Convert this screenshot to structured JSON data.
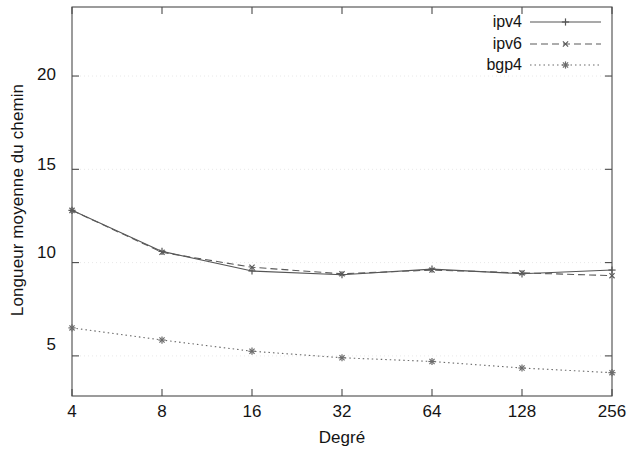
{
  "chart_data": {
    "type": "line",
    "title": "",
    "xlabel": "Degré",
    "ylabel": "Longueur moyenne du chemin",
    "x": [
      4,
      8,
      16,
      32,
      64,
      128,
      256
    ],
    "categories": [
      "4",
      "8",
      "16",
      "32",
      "64",
      "128",
      "256"
    ],
    "xscale": "log2",
    "xtick_labels": [
      "4",
      "8",
      "16",
      "32",
      "64",
      "128",
      "256"
    ],
    "ytick_labels": [
      "5",
      "10",
      "15",
      "20"
    ],
    "ytick_values": [
      5,
      10,
      15,
      20
    ],
    "ylim": [
      2.85,
      23.7
    ],
    "grid": true,
    "grid_style": "dotted",
    "legend_position": "top-right",
    "series": [
      {
        "name": "ipv4",
        "values": [
          12.8,
          10.6,
          9.55,
          9.35,
          9.65,
          9.4,
          9.6
        ],
        "line_style": "solid",
        "marker": "plus",
        "color": "#555555"
      },
      {
        "name": "ipv6",
        "values": [
          12.8,
          10.55,
          9.75,
          9.4,
          9.6,
          9.45,
          9.3
        ],
        "line_style": "dashed",
        "marker": "cross",
        "color": "#5a5a5a"
      },
      {
        "name": "bgp4",
        "values": [
          6.5,
          5.85,
          5.25,
          4.9,
          4.7,
          4.35,
          4.1
        ],
        "line_style": "dotted",
        "marker": "star",
        "color": "#6a6a6a"
      }
    ]
  },
  "axis": {
    "y_title": "Longueur moyenne du chemin",
    "x_title": "Degré",
    "yticks": [
      {
        "label": "20"
      },
      {
        "label": "15"
      },
      {
        "label": "10"
      },
      {
        "label": "5"
      }
    ],
    "xticks": [
      {
        "label": "4"
      },
      {
        "label": "8"
      },
      {
        "label": "16"
      },
      {
        "label": "32"
      },
      {
        "label": "64"
      },
      {
        "label": "128"
      },
      {
        "label": "256"
      }
    ]
  },
  "legend": {
    "entries": [
      {
        "label": "ipv4"
      },
      {
        "label": "ipv6"
      },
      {
        "label": "bgp4"
      }
    ]
  }
}
